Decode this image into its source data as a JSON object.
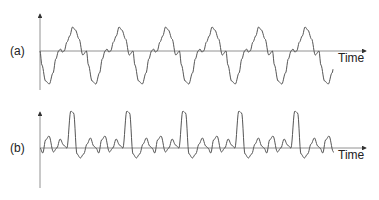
{
  "panels": [
    {
      "label": "(a)",
      "axis_label": "Time",
      "description": "periodic waveform with fundamental period ~46px"
    },
    {
      "label": "(b)",
      "axis_label": "Time",
      "description": "periodic waveform with sharp peaks, period ~56px"
    }
  ],
  "colors": {
    "line": "#555555",
    "axis": "#666666",
    "text": "#222222"
  }
}
